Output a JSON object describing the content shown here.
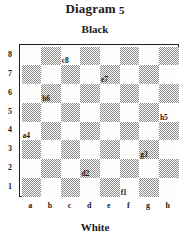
{
  "title": {
    "word": "Diagram",
    "number": "5"
  },
  "top_label": "Black",
  "bottom_label": "White",
  "board": {
    "files": [
      "a",
      "b",
      "c",
      "d",
      "e",
      "f",
      "g",
      "h"
    ],
    "ranks": [
      "8",
      "7",
      "6",
      "5",
      "4",
      "3",
      "2",
      "1"
    ],
    "light_color": "#fdfdfb",
    "dark_color": "#8c8c8c",
    "border_color": "#222222",
    "marked_squares": [
      "c8",
      "e7",
      "b6",
      "h5",
      "a4",
      "g3",
      "d2",
      "f1"
    ],
    "squares": [
      [
        {
          "id": "a8",
          "shade": "light",
          "label": ""
        },
        {
          "id": "b8",
          "shade": "dark",
          "label": ""
        },
        {
          "id": "c8",
          "shade": "light",
          "label": "c8"
        },
        {
          "id": "d8",
          "shade": "dark",
          "label": ""
        },
        {
          "id": "e8",
          "shade": "light",
          "label": ""
        },
        {
          "id": "f8",
          "shade": "dark",
          "label": ""
        },
        {
          "id": "g8",
          "shade": "light",
          "label": ""
        },
        {
          "id": "h8",
          "shade": "dark",
          "label": ""
        }
      ],
      [
        {
          "id": "a7",
          "shade": "dark",
          "label": ""
        },
        {
          "id": "b7",
          "shade": "light",
          "label": ""
        },
        {
          "id": "c7",
          "shade": "dark",
          "label": ""
        },
        {
          "id": "d7",
          "shade": "light",
          "label": ""
        },
        {
          "id": "e7",
          "shade": "dark",
          "label": "e7"
        },
        {
          "id": "f7",
          "shade": "light",
          "label": ""
        },
        {
          "id": "g7",
          "shade": "dark",
          "label": ""
        },
        {
          "id": "h7",
          "shade": "light",
          "label": ""
        }
      ],
      [
        {
          "id": "a6",
          "shade": "light",
          "label": ""
        },
        {
          "id": "b6",
          "shade": "dark",
          "label": "b6"
        },
        {
          "id": "c6",
          "shade": "light",
          "label": ""
        },
        {
          "id": "d6",
          "shade": "dark",
          "label": ""
        },
        {
          "id": "e6",
          "shade": "light",
          "label": ""
        },
        {
          "id": "f6",
          "shade": "dark",
          "label": ""
        },
        {
          "id": "g6",
          "shade": "light",
          "label": ""
        },
        {
          "id": "h6",
          "shade": "dark",
          "label": ""
        }
      ],
      [
        {
          "id": "a5",
          "shade": "dark",
          "label": ""
        },
        {
          "id": "b5",
          "shade": "light",
          "label": ""
        },
        {
          "id": "c5",
          "shade": "dark",
          "label": ""
        },
        {
          "id": "d5",
          "shade": "light",
          "label": ""
        },
        {
          "id": "e5",
          "shade": "dark",
          "label": ""
        },
        {
          "id": "f5",
          "shade": "light",
          "label": ""
        },
        {
          "id": "g5",
          "shade": "dark",
          "label": ""
        },
        {
          "id": "h5",
          "shade": "light",
          "label": "h5"
        }
      ],
      [
        {
          "id": "a4",
          "shade": "light",
          "label": "a4"
        },
        {
          "id": "b4",
          "shade": "dark",
          "label": ""
        },
        {
          "id": "c4",
          "shade": "light",
          "label": ""
        },
        {
          "id": "d4",
          "shade": "dark",
          "label": ""
        },
        {
          "id": "e4",
          "shade": "light",
          "label": ""
        },
        {
          "id": "f4",
          "shade": "dark",
          "label": ""
        },
        {
          "id": "g4",
          "shade": "light",
          "label": ""
        },
        {
          "id": "h4",
          "shade": "dark",
          "label": ""
        }
      ],
      [
        {
          "id": "a3",
          "shade": "dark",
          "label": ""
        },
        {
          "id": "b3",
          "shade": "light",
          "label": ""
        },
        {
          "id": "c3",
          "shade": "dark",
          "label": ""
        },
        {
          "id": "d3",
          "shade": "light",
          "label": ""
        },
        {
          "id": "e3",
          "shade": "dark",
          "label": ""
        },
        {
          "id": "f3",
          "shade": "light",
          "label": ""
        },
        {
          "id": "g3",
          "shade": "dark",
          "label": "g3"
        },
        {
          "id": "h3",
          "shade": "light",
          "label": ""
        }
      ],
      [
        {
          "id": "a2",
          "shade": "light",
          "label": ""
        },
        {
          "id": "b2",
          "shade": "dark",
          "label": ""
        },
        {
          "id": "c2",
          "shade": "light",
          "label": ""
        },
        {
          "id": "d2",
          "shade": "dark",
          "label": "d2"
        },
        {
          "id": "e2",
          "shade": "light",
          "label": ""
        },
        {
          "id": "f2",
          "shade": "dark",
          "label": ""
        },
        {
          "id": "g2",
          "shade": "light",
          "label": ""
        },
        {
          "id": "h2",
          "shade": "dark",
          "label": ""
        }
      ],
      [
        {
          "id": "a1",
          "shade": "dark",
          "label": ""
        },
        {
          "id": "b1",
          "shade": "light",
          "label": ""
        },
        {
          "id": "c1",
          "shade": "dark",
          "label": ""
        },
        {
          "id": "d1",
          "shade": "light",
          "label": ""
        },
        {
          "id": "e1",
          "shade": "dark",
          "label": ""
        },
        {
          "id": "f1",
          "shade": "light",
          "label": "f1"
        },
        {
          "id": "g1",
          "shade": "dark",
          "label": ""
        },
        {
          "id": "h1",
          "shade": "light",
          "label": ""
        }
      ]
    ]
  }
}
